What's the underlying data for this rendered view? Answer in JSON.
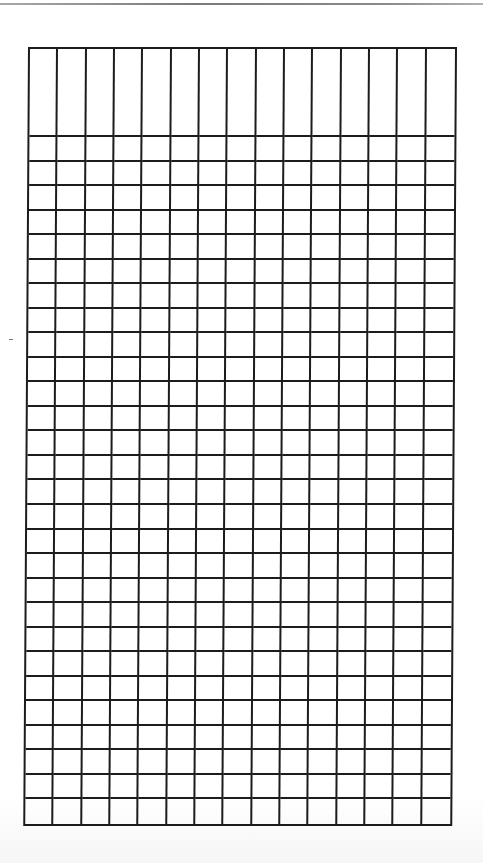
{
  "document": {
    "type": "blank-grid-form",
    "top_rule_color": "#8a8a8a",
    "line_color": "#1c1c1c",
    "background_color": "#ffffff"
  },
  "grid": {
    "columns": 15,
    "header_rows": 1,
    "header_row_height_px": 88,
    "body_rows": 28,
    "body_row_height_px": 24.6,
    "header_cells": [
      "",
      "",
      "",
      "",
      "",
      "",
      "",
      "",
      "",
      "",
      "",
      "",
      "",
      "",
      ""
    ],
    "body_cells_text": ""
  }
}
